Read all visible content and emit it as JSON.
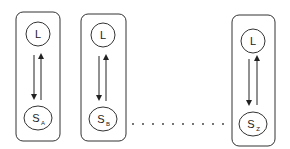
{
  "diagram": {
    "type": "state-pairs",
    "units": [
      {
        "id": "A",
        "top_label": "L",
        "bottom_label": "S",
        "bottom_subscript": "A",
        "box": {
          "x": 16,
          "y": 12,
          "w": 44,
          "h": 129
        }
      },
      {
        "id": "B",
        "top_label": "L",
        "bottom_label": "S",
        "bottom_subscript": "B",
        "box": {
          "x": 81,
          "y": 14,
          "w": 45,
          "h": 127
        }
      },
      {
        "id": "Z",
        "top_label": "L",
        "bottom_label": "S",
        "bottom_subscript": "Z",
        "box": {
          "x": 232,
          "y": 15,
          "w": 43,
          "h": 131
        }
      }
    ],
    "ellipsis": {
      "dots": 10,
      "y": 124,
      "x_start": 130,
      "x_end": 226
    },
    "arrows": "bidirectional vertical arrows between L and S in each unit",
    "colors": {
      "stroke": "#333333",
      "background": "#ffffff"
    }
  }
}
